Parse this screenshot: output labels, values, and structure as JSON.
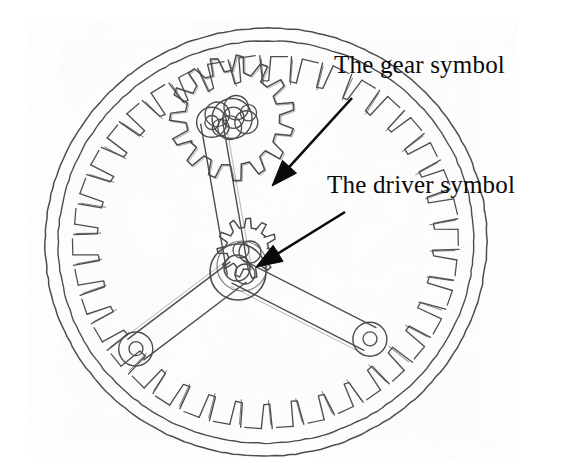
{
  "figure": {
    "kind": "engineering-line-drawing",
    "background_color": "#ffffff",
    "ink_color": "#4a4a4a",
    "text_color": "#0a0a0a",
    "width": 563,
    "height": 472
  },
  "labels": {
    "gear": {
      "text": "The gear symbol",
      "x": 334,
      "y": 52
    },
    "driver": {
      "text": "The driver symbol",
      "x": 327,
      "y": 172
    }
  },
  "annotations": {
    "leaders": [
      {
        "name": "gear-leader-arrow",
        "from_x": 352,
        "from_y": 98,
        "to_x": 272,
        "to_y": 186
      },
      {
        "name": "driver-leader-arrow",
        "from_x": 345,
        "from_y": 212,
        "to_x": 256,
        "to_y": 267
      }
    ]
  },
  "drawing": {
    "ring_gear": {
      "name": "internal-ring-gear",
      "center_x": 266,
      "center_y": 242,
      "rim_outer_rx": 221,
      "rim_outer_ry": 214,
      "rim_inner_rx": 208,
      "rim_inner_ry": 201,
      "teeth_count": 38,
      "teeth_root_rx": 193,
      "teeth_root_ry": 186,
      "teeth_tip_rx": 168,
      "teeth_tip_ry": 162,
      "rotation_deg": -8
    },
    "planet_gear": {
      "name": "planet-spur-gear",
      "center_x": 232,
      "center_y": 118,
      "tip_radius": 62,
      "root_radius": 47,
      "teeth_count": 15,
      "hub_radius": 20
    },
    "sun_gear": {
      "name": "sun-gear-symbol",
      "center_x": 247,
      "center_y": 248,
      "tip_radius": 30,
      "root_radius": 21,
      "teeth_count": 11
    },
    "driver_hub": {
      "name": "driver-hub",
      "center_x": 238,
      "center_y": 272,
      "radius": 28,
      "inner_radius": 13
    },
    "arms": [
      {
        "name": "arm-upper",
        "angle_deg": -100,
        "length": 152,
        "half_width": 11,
        "end_hole_radius": 7
      },
      {
        "name": "arm-lower-left",
        "angle_deg": 143,
        "length": 128,
        "half_width": 13,
        "end_hole_radius": 7
      },
      {
        "name": "arm-lower-right",
        "angle_deg": 27,
        "length": 148,
        "half_width": 13,
        "end_hole_radius": 7
      }
    ]
  }
}
